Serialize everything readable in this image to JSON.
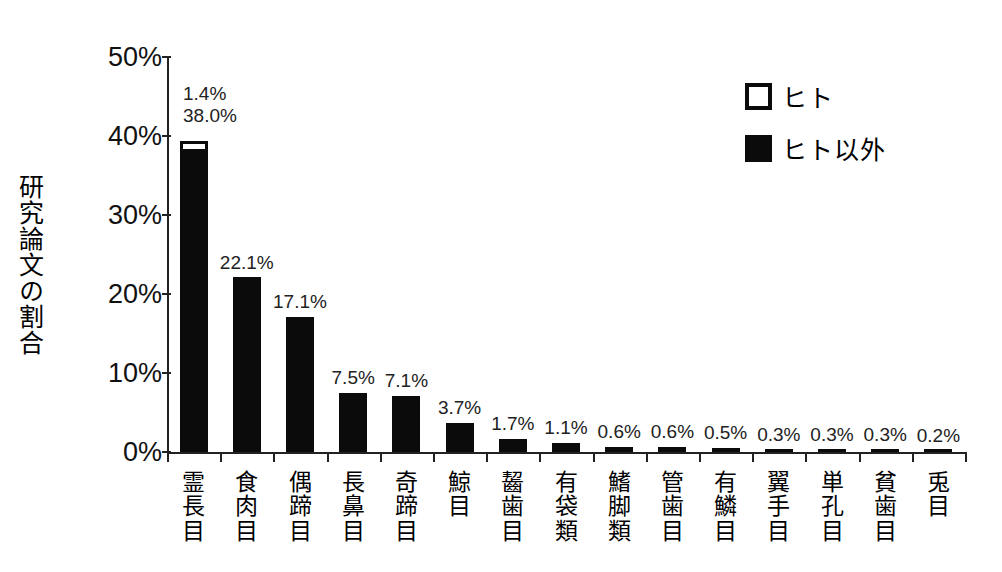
{
  "chart_data": {
    "type": "bar",
    "subtype": "stacked-bar",
    "title": "",
    "xlabel": "",
    "ylabel": "研究論文の割合",
    "ylim": [
      0,
      50
    ],
    "ytick_labels": [
      "50%",
      "40%",
      "30%",
      "20%",
      "10%",
      "0%"
    ],
    "ytick_values": [
      50,
      40,
      30,
      20,
      10,
      0
    ],
    "grid": false,
    "legend_position": "top-right",
    "categories": [
      "霊長目",
      "食肉目",
      "偶蹄目",
      "長鼻目",
      "奇蹄目",
      "鯨目",
      "齧歯目",
      "有袋類",
      "鰭脚類",
      "管歯目",
      "有鱗目",
      "翼手目",
      "単孔目",
      "貧歯目",
      "兎目"
    ],
    "series": [
      {
        "name": "ヒト",
        "color": "#ffffff",
        "values": [
          1.4,
          0,
          0,
          0,
          0,
          0,
          0,
          0,
          0,
          0,
          0,
          0,
          0,
          0,
          0
        ]
      },
      {
        "name": "ヒト以外",
        "color": "#0b0b0b",
        "values": [
          38.0,
          22.1,
          17.1,
          7.5,
          7.1,
          3.7,
          1.7,
          1.1,
          0.6,
          0.6,
          0.5,
          0.3,
          0.3,
          0.3,
          0.2
        ]
      }
    ],
    "bar_value_labels": [
      [
        "1.4%",
        "38.0%"
      ],
      [
        "22.1%"
      ],
      [
        "17.1%"
      ],
      [
        "7.5%"
      ],
      [
        "7.1%"
      ],
      [
        "3.7%"
      ],
      [
        "1.7%"
      ],
      [
        "1.1%"
      ],
      [
        "0.6%"
      ],
      [
        "0.6%"
      ],
      [
        "0.5%"
      ],
      [
        "0.3%"
      ],
      [
        "0.3%"
      ],
      [
        "0.3%"
      ],
      [
        "0.2%"
      ]
    ]
  },
  "legend": {
    "entries": [
      {
        "label": "ヒト",
        "swatch": "open-square"
      },
      {
        "label": "ヒト以外",
        "swatch": "filled-square"
      }
    ]
  },
  "colors": {
    "background": "#ffffff",
    "axis": "#222222",
    "bar_fill": "#0b0b0b",
    "human_fill": "#ffffff",
    "text": "#111111"
  }
}
